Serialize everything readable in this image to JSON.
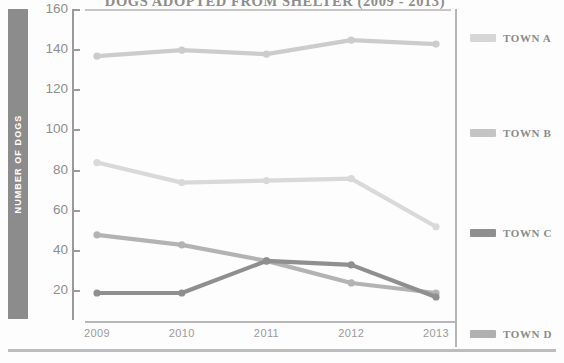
{
  "chart_data": {
    "type": "line",
    "title": "DOGS ADOPTED FROM SHELTER (2009 - 2013)",
    "xlabel": "",
    "ylabel": "NUMBER OF DOGS",
    "categories": [
      "2009",
      "2010",
      "2011",
      "2012",
      "2013"
    ],
    "ylim": [
      0,
      160
    ],
    "yticks": [
      20,
      40,
      60,
      80,
      100,
      120,
      140,
      160
    ],
    "grid": false,
    "legend_position": "right",
    "series": [
      {
        "name": "TOWN A",
        "values": [
          137,
          140,
          138,
          145,
          143
        ],
        "color": "#cccccc"
      },
      {
        "name": "TOWN B",
        "values": [
          84,
          74,
          75,
          76,
          52
        ],
        "color": "#d9d9d9"
      },
      {
        "name": "TOWN C",
        "values": [
          19,
          19,
          35,
          33,
          17
        ],
        "color": "#8f8f8f"
      },
      {
        "name": "TOWN D",
        "values": [
          48,
          43,
          35,
          24,
          19
        ],
        "color": "#b3b3b3"
      }
    ]
  },
  "axis": {
    "y_title": "NUMBER OF DOGS",
    "y_labels": [
      "160",
      "140",
      "120",
      "100",
      "80",
      "60",
      "40",
      "20"
    ],
    "x_labels": [
      "2009",
      "2010",
      "2011",
      "2012",
      "2013"
    ]
  },
  "legend": {
    "items": [
      {
        "label": "TOWN A",
        "color": "#d6d6d6"
      },
      {
        "label": "TOWN B",
        "color": "#c4c4c4"
      },
      {
        "label": "TOWN C",
        "color": "#8f8f8f"
      },
      {
        "label": "TOWN D",
        "color": "#b0b0b0"
      }
    ]
  }
}
